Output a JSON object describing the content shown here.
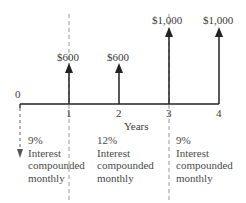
{
  "diagram": {
    "type": "cash-flow-timeline",
    "axis": {
      "label": "Years",
      "origin_label": "0",
      "ticks": [
        "1",
        "2",
        "3",
        "4"
      ]
    },
    "cash_flows": [
      {
        "year": "1",
        "amount": "$600"
      },
      {
        "year": "2",
        "amount": "$600"
      },
      {
        "year": "3",
        "amount": "$1,000"
      },
      {
        "year": "4",
        "amount": "$1,000"
      }
    ],
    "periods": [
      {
        "rate": "9%",
        "line1": "Interest",
        "line2": "compounded",
        "line3": "monthly"
      },
      {
        "rate": "12%",
        "line1": "Interest",
        "line2": "compounded",
        "line3": "monthly"
      },
      {
        "rate": "9%",
        "line1": "Interest",
        "line2": "compounded",
        "line3": "monthly"
      }
    ],
    "colors": {
      "line": "#222222",
      "dashed": "#888888",
      "text": "#3a3a3a"
    }
  }
}
